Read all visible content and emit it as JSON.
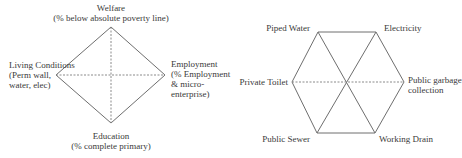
{
  "diamond": {
    "top": {
      "title": "Welfare",
      "sub": "(% below absolute poverty line)"
    },
    "right": {
      "line1": "Employment",
      "line2": "(% Employment",
      "line3": "& micro-",
      "line4": "enterprise)"
    },
    "bottom": {
      "title": "Education",
      "sub": "(% complete primary)"
    },
    "left": {
      "line1": "Living Conditions",
      "line2": "(Perm wall,",
      "line3": "water, elec)"
    }
  },
  "hexagon": {
    "top_left": "Piped Water",
    "top_right": "Electricity",
    "right": {
      "line1": "Public garbage",
      "line2": "collection"
    },
    "bottom_right": "Working Drain",
    "bottom_left": "Public Sewer",
    "left": "Private Toilet"
  },
  "colors": {
    "line": "#6e6e6e",
    "dash": "#8a8a8a",
    "text": "#3a3a3a"
  }
}
